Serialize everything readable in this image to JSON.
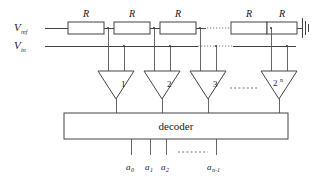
{
  "figure": {
    "type": "circuit-schematic"
  },
  "rails": {
    "vref_label": "V",
    "vref_sub": "ref",
    "vin_label": "V",
    "vin_sub": "in"
  },
  "resistors": [
    {
      "label": "R"
    },
    {
      "label": "R"
    },
    {
      "label": "R"
    },
    {
      "label": "R"
    },
    {
      "label": "R"
    }
  ],
  "ground": {
    "name": "ground-symbol"
  },
  "comparators": [
    {
      "label": "1",
      "sup": ""
    },
    {
      "label": "2",
      "sup": ""
    },
    {
      "label": "3",
      "sup": ""
    },
    {
      "label": "2",
      "sup": "n"
    }
  ],
  "decoder": {
    "label": "decoder"
  },
  "outputs": [
    {
      "label": "a",
      "sub": "0"
    },
    {
      "label": "a",
      "sub": "1"
    },
    {
      "label": "a",
      "sub": "2"
    },
    {
      "label": "a",
      "sub": "n-1"
    }
  ],
  "ellipses": {
    "ladder": "dotted",
    "vin_rail": "dotted",
    "comparators": "dashed",
    "outputs": "dashed"
  },
  "colors": {
    "wire": "#444444",
    "text": "#1a1a1a",
    "background": "#ffffff",
    "dashed": "#777777"
  }
}
